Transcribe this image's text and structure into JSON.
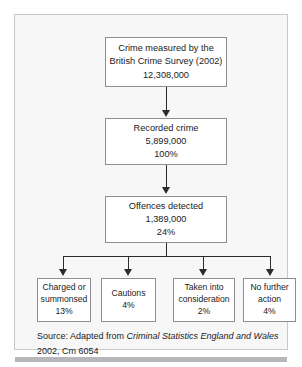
{
  "figure": {
    "type": "flowchart",
    "orientation": "top-down",
    "nodes": [
      {
        "id": "bcs",
        "lines": [
          "Crime measured by the",
          "British Crime Survey (2002)",
          "12,308,000"
        ]
      },
      {
        "id": "recorded",
        "lines": [
          "Recorded crime",
          "5,899,000",
          "100%"
        ]
      },
      {
        "id": "offences",
        "lines": [
          "Offences detected",
          "1,389,000",
          "24%"
        ]
      }
    ],
    "outcomes": [
      {
        "id": "charged",
        "lines": [
          "Charged or",
          "summonsed",
          "13%"
        ]
      },
      {
        "id": "cautions",
        "lines": [
          "Cautions",
          "4%"
        ]
      },
      {
        "id": "taken",
        "lines": [
          "Taken into",
          "consideration",
          "2%"
        ]
      },
      {
        "id": "nofurther",
        "lines": [
          "No further",
          "action",
          "4%"
        ]
      }
    ],
    "source": {
      "prefix": "Source: Adapted from ",
      "title": "Criminal Statistics England and Wales",
      "suffix": " 2002, Cm 6054"
    },
    "colors": {
      "panel_background": "#f7f7f8",
      "panel_border": "#c9c9cc",
      "node_background": "#ffffff",
      "node_border": "#8e8e93",
      "connector": "#2b2b2b",
      "text": "#1b1b1b",
      "bottom_rule": "#b7b7bb"
    }
  }
}
